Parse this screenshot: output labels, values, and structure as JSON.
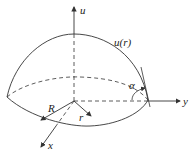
{
  "diagram": {
    "labels": {
      "u_axis": "u",
      "y_axis": "y",
      "x_axis": "x",
      "surface": "u(r)",
      "radius_R": "R",
      "radius_r": "r",
      "angle": "α"
    },
    "colors": {
      "stroke": "#333333",
      "background": "#ffffff"
    }
  }
}
